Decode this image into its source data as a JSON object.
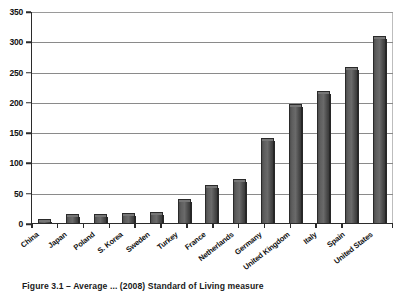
{
  "chart_data": {
    "type": "bar",
    "title": "",
    "xlabel": "",
    "ylabel": "",
    "ylim": [
      0,
      350
    ],
    "yticks": [
      0,
      50,
      100,
      150,
      200,
      250,
      300,
      350
    ],
    "ytick_labels": [
      "0",
      "50",
      "100",
      "150",
      "200",
      "250",
      "300",
      "350"
    ],
    "grid": "horizontal",
    "legend": "none",
    "orientation": "vertical",
    "bar_style": "3d-shaded-gray",
    "categories": [
      "China",
      "Japan",
      "Poland",
      "S. Korea",
      "Sweden",
      "Turkey",
      "France",
      "Netherlands",
      "Germany",
      "United Kingdom",
      "Italy",
      "Spain",
      "United States"
    ],
    "values": [
      8,
      16,
      16,
      18,
      20,
      42,
      65,
      75,
      142,
      198,
      220,
      260,
      310
    ]
  },
  "colors": {
    "bar_fill": "#5e5e5e",
    "bar_edge": "#2a2a2a",
    "bar_shadow": "#272727",
    "gridline": "#8a8a8a",
    "axis": "#2b2b2b",
    "text": "#111111",
    "background": "#ffffff"
  },
  "caption": {
    "text": "Figure 3.1 – Average ... (2008) Standard of Living measure"
  }
}
